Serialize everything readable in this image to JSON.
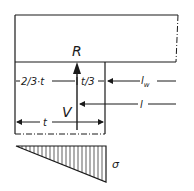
{
  "diagram": {
    "labels": {
      "resultant": "R",
      "shear": "V",
      "two_thirds": "2/3·t",
      "one_third": "t/3",
      "wall_length": "l",
      "wall_length_sub": "w",
      "lever": "l",
      "thickness": "t",
      "stress": "σ"
    },
    "colors": {
      "line": "#1a1a1a",
      "background": "#ffffff"
    },
    "elements": [
      "upper-block (dash-dot right edge)",
      "wall-section with dash-dot bottom edge",
      "resultant-arrow R pointing up",
      "dimension 2/3·t and t/3",
      "dimension l_w",
      "dimension l to V",
      "dimension t",
      "triangular stress distribution σ (hatched)"
    ]
  }
}
